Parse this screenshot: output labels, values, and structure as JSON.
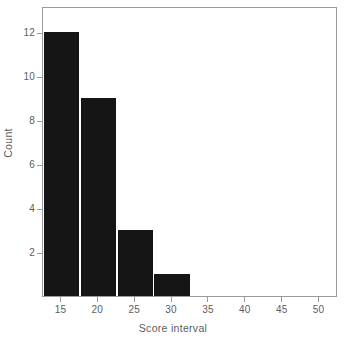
{
  "chart_data": {
    "type": "bar",
    "title": "",
    "xlabel": "Score interval",
    "ylabel": "Count",
    "categories": [
      "15",
      "20",
      "25",
      "30",
      "35",
      "40",
      "45",
      "50"
    ],
    "values": [
      12,
      9,
      3,
      1,
      0,
      0,
      0,
      0
    ],
    "x_tick_labels": [
      "15",
      "20",
      "25",
      "30",
      "35",
      "40",
      "45",
      "50"
    ],
    "y_tick_labels": [
      "2",
      "4",
      "6",
      "8",
      "10",
      "12"
    ],
    "y_tick_values": [
      2,
      4,
      6,
      8,
      10,
      12
    ],
    "xlim": [
      12.5,
      52.5
    ],
    "ylim": [
      0,
      13.2
    ],
    "grid": false,
    "legend": false,
    "bar_color": "#151515",
    "axis_color": "#9a9a9a",
    "text_color": "#5c5c5c",
    "background": "#ffffff"
  }
}
